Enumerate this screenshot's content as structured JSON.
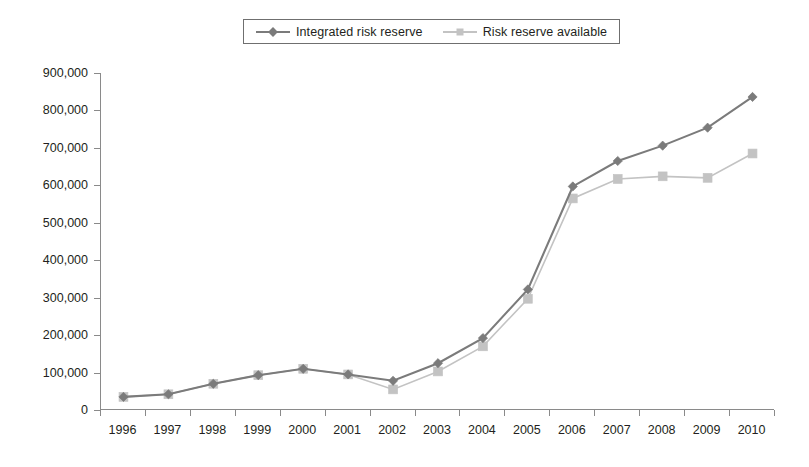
{
  "legend": {
    "position": "top-center",
    "entries": [
      {
        "label": "Integrated risk reserve",
        "color": "#7b7b7b",
        "marker": "diamond"
      },
      {
        "label": "Risk reserve available",
        "color": "#c3c3c3",
        "marker": "square"
      }
    ]
  },
  "chart_data": {
    "type": "line",
    "title": "",
    "subtitle": "",
    "xlabel": "",
    "ylabel": "",
    "grid": false,
    "legend_position": "top-center",
    "xlim": [
      1996,
      2010
    ],
    "ylim": [
      0,
      900000
    ],
    "ytick_step": 100000,
    "categories": [
      "1996",
      "1997",
      "1998",
      "1999",
      "2000",
      "2001",
      "2002",
      "2003",
      "2004",
      "2005",
      "2006",
      "2007",
      "2008",
      "2009",
      "2010"
    ],
    "ytick_labels": [
      "0",
      "100,000",
      "200,000",
      "300,000",
      "400,000",
      "500,000",
      "600,000",
      "700,000",
      "800,000",
      "900,000"
    ],
    "ytick_values": [
      0,
      100000,
      200000,
      300000,
      400000,
      500000,
      600000,
      700000,
      800000,
      900000
    ],
    "series": [
      {
        "name": "Integrated risk reserve",
        "color": "#7b7b7b",
        "marker": "diamond",
        "values": [
          35000,
          42000,
          70000,
          93000,
          110000,
          95000,
          78000,
          125000,
          192000,
          322000,
          597000,
          665000,
          706000,
          754000,
          836000
        ]
      },
      {
        "name": "Risk reserve available",
        "color": "#c3c3c3",
        "marker": "square",
        "values": [
          35000,
          42000,
          70000,
          93000,
          110000,
          95000,
          55000,
          103000,
          170000,
          297000,
          565000,
          617000,
          624000,
          620000,
          685000
        ]
      }
    ],
    "annotations": []
  },
  "axis": {
    "line_color": "#8a8a8a"
  }
}
